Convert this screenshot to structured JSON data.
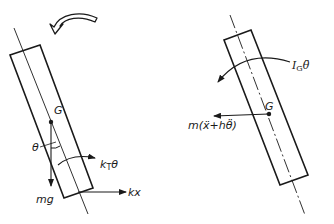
{
  "diagram": {
    "type": "free-body-diagram",
    "left_panel": {
      "name": "applied-forces",
      "labels": {
        "center_of_mass": "G",
        "angle": "θ",
        "torsional_spring_moment_k": "k",
        "torsional_spring_moment_sub": "T",
        "torsional_spring_moment_var": "θ",
        "spring_force": "kx",
        "weight": "mg"
      },
      "rotation_arrow": "counterclockwise"
    },
    "right_panel": {
      "name": "inertial-forces",
      "labels": {
        "center_of_mass": "G",
        "inertia_moment_I": "I",
        "inertia_moment_sub": "G",
        "inertia_moment_var": "θ̈",
        "inertial_force": "m(ẍ+hθ̈)"
      }
    },
    "colors": {
      "line": "#1a1a1a",
      "background": "#ffffff"
    }
  }
}
